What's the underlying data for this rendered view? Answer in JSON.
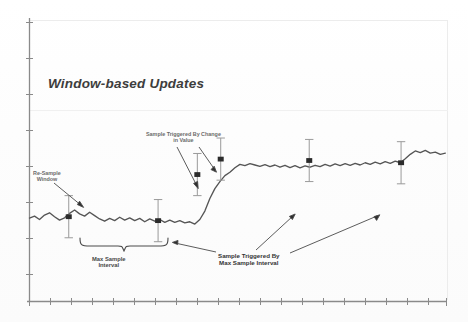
{
  "figure": {
    "title": "Window-based Updates",
    "annotations": {
      "change_line1": "Sample Triggered By Change",
      "change_line2": "in Value",
      "resample_line1": "Re-Sample",
      "resample_line2": "Window",
      "max_interval_line1": "Max Sample",
      "max_interval_line2": "Interval",
      "trig_max_line1": "Sample Triggered By",
      "trig_max_line2": "Max Sample Interval"
    },
    "colors": {
      "ink": "#4a4a4a",
      "axis": "#6e6e6e",
      "trace": "#555555",
      "frame": "#e9e9e9",
      "paper": "#ffffff"
    }
  },
  "chart_data": {
    "type": "line",
    "title": "Window-based Updates",
    "xlabel": "",
    "ylabel": "",
    "grid": false,
    "legend": "none",
    "axis": {
      "x_ticks_count": 21,
      "x_tick_labels": [],
      "y_ticks_count": 8,
      "y_tick_labels": [],
      "xlim": [
        0,
        100
      ],
      "ylim": [
        0,
        100
      ]
    },
    "series": [
      {
        "name": "Signal",
        "comment": "Noisy signal with a step rise near the middle; values in chart units 0-100 on both axes",
        "x": [
          0,
          1.2,
          2.4,
          3.6,
          4.8,
          6.0,
          7.2,
          8.4,
          9.6,
          10.8,
          12.0,
          13.2,
          14.4,
          15.6,
          16.8,
          18.0,
          19.2,
          20.4,
          21.6,
          22.8,
          24.0,
          25.2,
          26.4,
          27.6,
          28.8,
          30.0,
          31.2,
          32.4,
          33.6,
          34.8,
          36.0,
          37.2,
          38.4,
          39.6,
          40.8,
          42.0,
          43.2,
          44.4,
          45.6,
          46.8,
          48.0,
          49.2,
          50.4,
          51.6,
          52.8,
          54.0,
          55.2,
          56.4,
          57.6,
          58.8,
          60.0,
          61.2,
          62.4,
          63.6,
          64.8,
          66.0,
          67.2,
          68.4,
          69.6,
          70.8,
          72.0,
          73.2,
          74.4,
          75.6,
          76.8,
          78.0,
          79.2,
          80.4,
          81.6,
          82.8,
          84.0,
          85.2,
          86.4,
          87.6,
          88.8,
          90.0,
          91.2,
          92.4,
          93.6,
          94.8,
          96.0,
          97.2,
          98.4,
          99.6
        ],
        "y": [
          29.5,
          30.2,
          29.0,
          30.6,
          31.4,
          30.0,
          28.8,
          29.6,
          31.2,
          32.4,
          31.0,
          30.2,
          31.6,
          30.4,
          29.2,
          28.4,
          29.4,
          28.6,
          29.8,
          28.8,
          29.6,
          28.6,
          29.4,
          28.2,
          29.2,
          28.4,
          29.0,
          28.0,
          28.8,
          28.0,
          28.6,
          27.8,
          28.2,
          27.4,
          29.0,
          32.0,
          36.5,
          40.0,
          42.5,
          44.6,
          45.8,
          47.4,
          48.6,
          48.2,
          48.9,
          48.4,
          47.9,
          48.5,
          47.8,
          48.4,
          47.6,
          48.3,
          47.5,
          48.2,
          47.4,
          48.1,
          47.6,
          48.3,
          47.8,
          48.6,
          48.0,
          48.8,
          48.2,
          48.9,
          48.3,
          49.0,
          48.4,
          49.2,
          48.6,
          49.4,
          48.8,
          49.6,
          49.0,
          49.8,
          49.2,
          50.6,
          52.2,
          53.4,
          52.8,
          53.6,
          52.6,
          53.0,
          52.2,
          52.6
        ]
      }
    ],
    "sample_markers": [
      {
        "label": "sample-1",
        "x": 9.4,
        "y": 30.0,
        "errbar_half": 7.5
      },
      {
        "label": "sample-2",
        "x": 30.8,
        "y": 28.6,
        "errbar_half": 7.5
      },
      {
        "label": "sample-3",
        "x": 40.2,
        "y": 45.0,
        "errbar_half": 7.5
      },
      {
        "label": "sample-4",
        "x": 45.8,
        "y": 50.5,
        "errbar_half": 7.5
      },
      {
        "label": "sample-5",
        "x": 67.0,
        "y": 50.0,
        "errbar_half": 7.5
      },
      {
        "label": "sample-6",
        "x": 89.0,
        "y": 49.2,
        "errbar_half": 7.5
      }
    ],
    "brace": {
      "label": "Max Sample Interval",
      "x_start": 9.4,
      "x_end": 30.8
    }
  }
}
